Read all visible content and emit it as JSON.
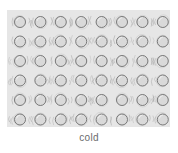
{
  "figure": {
    "title_label": "cold",
    "caption": "cold",
    "diagram_type": "particle-lattice",
    "state_of_matter": "solid",
    "description_text": "cold"
  },
  "lattice": {
    "rows": 6,
    "columns": 8,
    "particle_count": 48,
    "particle_diameter_px": 11,
    "column_spacing_px": 20.4,
    "row_spacing_px": 19.5,
    "origin_x_px": 13,
    "origin_y_px": 12,
    "vibration_marks_per_particle": 3,
    "arrangement": "regular close-packed grid",
    "motion": "vibrating in fixed positions"
  },
  "colors": {
    "page_background": "#ffffff",
    "box_background": "#e6e6e6",
    "particle_fill": "#d9d9d9",
    "particle_stroke": "#6e6e6e",
    "vibration_stroke": "#9a9a9a",
    "caption_text": "#6b6b6b"
  },
  "box": {
    "left_px": 7,
    "top_px": 10,
    "width_px": 163,
    "height_px": 117
  }
}
